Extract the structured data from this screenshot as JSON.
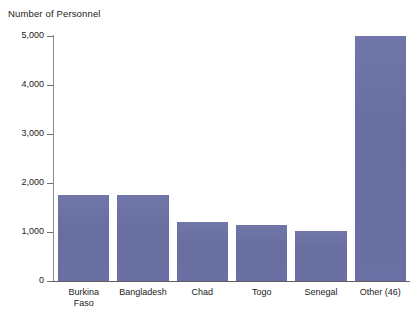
{
  "chart_data": {
    "type": "bar",
    "title": "Number of Personnel",
    "xlabel": "",
    "ylabel": "Number of Personnel",
    "categories": [
      "Burkina\nFaso",
      "Bangladesh",
      "Chad",
      "Togo",
      "Senegal",
      "Other (46)"
    ],
    "category_labels_flat": [
      "Burkina Faso",
      "Bangladesh",
      "Chad",
      "Togo",
      "Senegal",
      "Other (46)"
    ],
    "values": [
      1750,
      1750,
      1200,
      1150,
      1030,
      5000
    ],
    "ylim": [
      0,
      5000
    ],
    "yticks": [
      0,
      1000,
      2000,
      3000,
      4000,
      5000
    ],
    "ytick_labels": [
      "0",
      "1,000",
      "2,000",
      "3,000",
      "4,000",
      "5,000"
    ],
    "grid": false,
    "legend": false,
    "bar_color": "#6a6fa3",
    "axis_color": "#6e6e6e",
    "background": "#ffffff"
  }
}
